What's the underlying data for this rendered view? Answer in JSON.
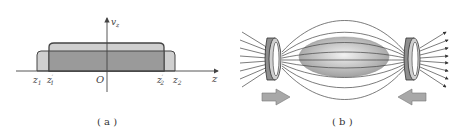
{
  "panel_a": {
    "caption": "( a )",
    "axes": {
      "y_label": "v",
      "y_sub": "z",
      "x_label": "z",
      "origin": "O"
    },
    "ticks": [
      {
        "main": "z",
        "sub": "1",
        "prime": ""
      },
      {
        "main": "z",
        "sub": "1",
        "prime": "′"
      },
      {
        "main": "z",
        "sub": "2",
        "prime": "′"
      },
      {
        "main": "z",
        "sub": "2",
        "prime": ""
      }
    ]
  },
  "panel_b": {
    "caption": "( b )"
  },
  "colors": {
    "line": "#3a3a3a",
    "light_fill": "#cfcfcf",
    "dark_fill": "#9a9a9a",
    "arrow_fill": "#a8a8a8"
  }
}
